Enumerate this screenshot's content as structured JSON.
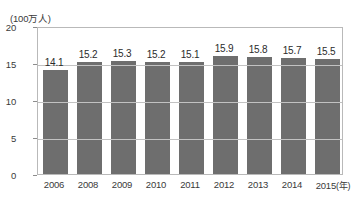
{
  "chart_data": {
    "type": "bar",
    "title": "",
    "subtitle": "",
    "unit_label": "(100万人)",
    "xlabel": "",
    "ylabel": "",
    "x_axis_suffix": "(年)",
    "categories": [
      "2006",
      "2008",
      "2009",
      "2010",
      "2011",
      "2012",
      "2013",
      "2014",
      "2015"
    ],
    "values": [
      14.1,
      15.2,
      15.3,
      15.2,
      15.1,
      15.9,
      15.8,
      15.7,
      15.5
    ],
    "value_labels": [
      "14.1",
      "15.2",
      "15.3",
      "15.2",
      "15.1",
      "15.9",
      "15.8",
      "15.7",
      "15.5"
    ],
    "ylim": [
      0,
      20
    ],
    "y_ticks": [
      0,
      5,
      10,
      15,
      20
    ],
    "y_tick_labels": [
      "0",
      "5",
      "10",
      "15",
      "20"
    ],
    "grid": true,
    "grid_axis": "y",
    "legend": false,
    "legend_position": "none",
    "bar_color": "#6e6e6e",
    "grid_color": "#c2c2c2",
    "frame_color": "#b9b9b9",
    "text_color": "#3a3a3a",
    "background": "#ffffff"
  }
}
